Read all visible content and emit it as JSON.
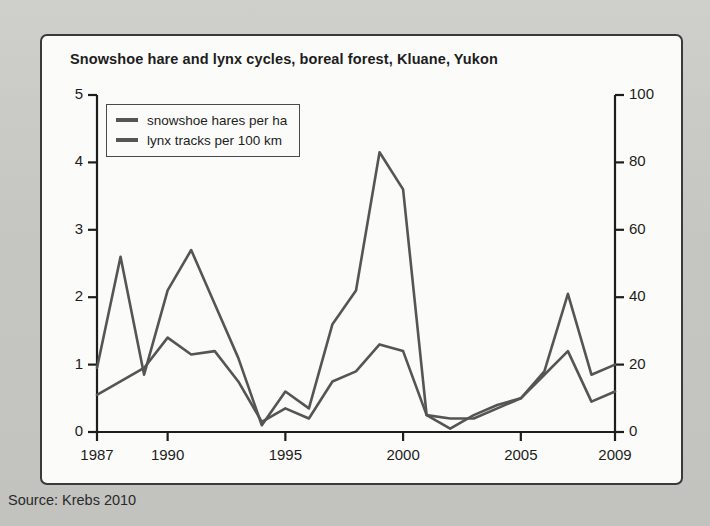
{
  "figure": {
    "title": "Snowshoe hare and lynx cycles, boreal forest, Kluane, Yukon",
    "source": "Source: Krebs 2010",
    "line_color": "#555555",
    "axis_color": "#1d1d1d",
    "panel_background": "#fbfbf9",
    "page_background": "#c9c9c6"
  },
  "legend": {
    "items": [
      {
        "label": "snowshoe hares per ha",
        "color": "#555555"
      },
      {
        "label": "lynx tracks per 100 km",
        "color": "#555555"
      }
    ]
  },
  "axes": {
    "left": {
      "label": "snowshoe hares per ha",
      "ticks": [
        "0",
        "1",
        "2",
        "3",
        "4",
        "5"
      ],
      "min": 0,
      "max": 5
    },
    "right": {
      "label": "lynx tracks per 100 km",
      "ticks": [
        "0",
        "20",
        "40",
        "60",
        "80",
        "100"
      ],
      "min": 0,
      "max": 100
    },
    "bottom": {
      "ticks": [
        "1987",
        "1990",
        "1995",
        "2000",
        "2005",
        "2009"
      ],
      "min": 1987,
      "max": 2009
    }
  },
  "chart_data": {
    "type": "line",
    "title": "Snowshoe hare and lynx cycles, boreal forest, Kluane, Yukon",
    "subtitle": "",
    "xlabel": "",
    "ylabel": "snowshoe hares per ha",
    "y2label": "lynx tracks per 100 km",
    "xlim": [
      1987,
      2009
    ],
    "ylim": [
      0,
      5
    ],
    "y2lim": [
      0,
      100
    ],
    "xticks": [
      1987,
      1990,
      1995,
      2000,
      2005,
      2009
    ],
    "yticks": [
      0,
      1,
      2,
      3,
      4,
      5
    ],
    "y2ticks": [
      0,
      20,
      40,
      60,
      80,
      100
    ],
    "grid": false,
    "legend_position": "top-left",
    "annotations": [
      "Source: Krebs 2010"
    ],
    "x": [
      1987,
      1988,
      1989,
      1990,
      1991,
      1992,
      1993,
      1994,
      1995,
      1996,
      1997,
      1998,
      1999,
      2000,
      2001,
      2002,
      2003,
      2004,
      2005,
      2006,
      2007,
      2008,
      2009
    ],
    "series": [
      {
        "name": "snowshoe hares per ha",
        "axis": "left",
        "units": "hares per ha",
        "values": [
          0.55,
          0.75,
          0.95,
          1.4,
          1.15,
          1.2,
          0.75,
          0.15,
          0.35,
          0.2,
          0.75,
          0.9,
          1.3,
          1.2,
          0.25,
          0.2,
          0.2,
          0.35,
          0.5,
          0.85,
          1.2,
          0.45,
          0.6
        ]
      },
      {
        "name": "lynx tracks per 100 km",
        "axis": "right",
        "units": "tracks per 100 km",
        "values": [
          19,
          52,
          17,
          42,
          54,
          38,
          22,
          2,
          12,
          7,
          32,
          42,
          83,
          72,
          5,
          1,
          5,
          8,
          10,
          18,
          41,
          17,
          20
        ]
      }
    ]
  }
}
